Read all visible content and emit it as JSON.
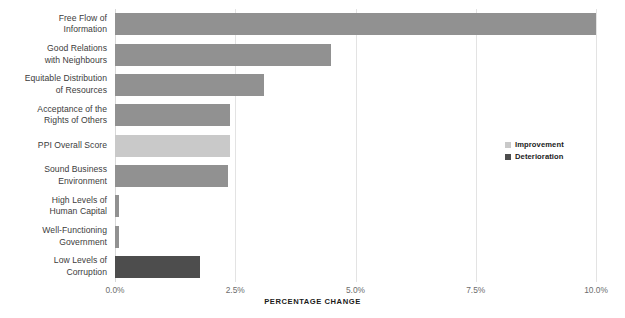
{
  "chart_data": {
    "type": "bar",
    "orientation": "horizontal",
    "title": "",
    "xlabel": "PERCENTAGE CHANGE",
    "ylabel": "",
    "xlim": [
      0.0,
      10.0
    ],
    "grid": true,
    "grid_axis": "x",
    "legend_position": "center-right",
    "xticks": [
      {
        "value": 0.0,
        "label": "0.0%"
      },
      {
        "value": 2.5,
        "label": "2.5%"
      },
      {
        "value": 5.0,
        "label": "5.0%"
      },
      {
        "value": 7.5,
        "label": "7.5%"
      },
      {
        "value": 10.0,
        "label": "10.0%"
      }
    ],
    "categories": [
      "Free Flow of Information",
      "Good Relations with Neighbours",
      "Equitable Distribution of Resources",
      "Acceptance of the Rights of Others",
      "PPI Overall Score",
      "Sound Business Environment",
      "High Levels of Human Capital",
      "Well-Functioning Government",
      "Low Levels of Corruption"
    ],
    "category_lines": [
      [
        "Free Flow of",
        "Information"
      ],
      [
        "Good Relations",
        "with Neighbours"
      ],
      [
        "Equitable Distribution",
        "of Resources"
      ],
      [
        "Acceptance of the",
        "Rights of Others"
      ],
      [
        "PPI Overall Score"
      ],
      [
        "Sound Business",
        "Environment"
      ],
      [
        "High Levels of",
        "Human Capital"
      ],
      [
        "Well-Functioning",
        "Government"
      ],
      [
        "Low Levels of",
        "Corruption"
      ]
    ],
    "values": [
      10.0,
      4.5,
      3.1,
      2.4,
      2.4,
      2.35,
      0.09,
      0.09,
      1.77
    ],
    "bar_series": [
      "improvement",
      "improvement",
      "improvement",
      "improvement",
      "highlight",
      "improvement",
      "improvement",
      "improvement",
      "deterioration"
    ],
    "colors": {
      "improvement": "#919191",
      "highlight": "#c9c9c9",
      "deterioration": "#4d4d4d",
      "gridline": "#e3e3e3",
      "axis_text": "#6d6d6d",
      "label_text": "#3c3c3c",
      "title_text": "#1b1b1b",
      "background": "#ffffff"
    },
    "series": [
      {
        "name": "Improvement",
        "swatch": "#c9c9c9"
      },
      {
        "name": "Deterioration",
        "swatch": "#4d4d4d"
      }
    ]
  },
  "legend": {
    "items": [
      {
        "label": "Improvement",
        "color": "#c9c9c9"
      },
      {
        "label": "Deterioration",
        "color": "#4d4d4d"
      }
    ]
  },
  "axis": {
    "x_title": "PERCENTAGE CHANGE"
  }
}
